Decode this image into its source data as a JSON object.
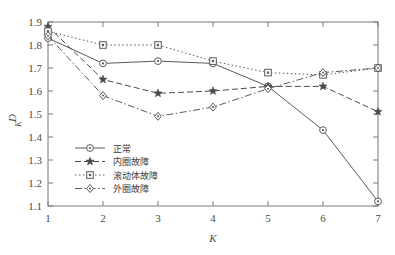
{
  "chart_data": {
    "type": "line",
    "title": "",
    "xlabel": "K",
    "ylabel": "D_K",
    "x": [
      1,
      2,
      3,
      4,
      5,
      6,
      7
    ],
    "xlim": [
      1,
      7
    ],
    "ylim": [
      1.1,
      1.9
    ],
    "xticks": [
      "1",
      "2",
      "3",
      "4",
      "5",
      "6",
      "7"
    ],
    "yticks": [
      "1.1",
      "1.2",
      "1.3",
      "1.4",
      "1.5",
      "1.6",
      "1.7",
      "1.8",
      "1.9"
    ],
    "grid": false,
    "legend_position": "center-left",
    "series": [
      {
        "name": "正常",
        "marker": "circle",
        "linestyle": "solid",
        "color": "#5a5a5a",
        "values": [
          1.83,
          1.72,
          1.73,
          1.72,
          1.62,
          1.43,
          1.12
        ]
      },
      {
        "name": "内圈故障",
        "marker": "star",
        "linestyle": "dashed",
        "color": "#4a4a4a",
        "values": [
          1.88,
          1.65,
          1.59,
          1.6,
          1.62,
          1.62,
          1.51
        ]
      },
      {
        "name": "滚动体故障",
        "marker": "square",
        "linestyle": "dotted",
        "color": "#5a5a5a",
        "values": [
          1.86,
          1.8,
          1.8,
          1.73,
          1.68,
          1.67,
          1.7
        ]
      },
      {
        "name": "外圈故障",
        "marker": "diamond",
        "linestyle": "dashdot",
        "color": "#5a5a5a",
        "values": [
          1.84,
          1.58,
          1.49,
          1.53,
          1.61,
          1.68,
          1.7
        ]
      }
    ]
  },
  "axes": {
    "y_label_main": "D",
    "y_label_sub": "K",
    "x_label": "K"
  },
  "legend": {
    "entries": [
      {
        "label": "正常"
      },
      {
        "label": "内圈故障"
      },
      {
        "label": "滚动体故障"
      },
      {
        "label": "外圈故障"
      }
    ]
  }
}
